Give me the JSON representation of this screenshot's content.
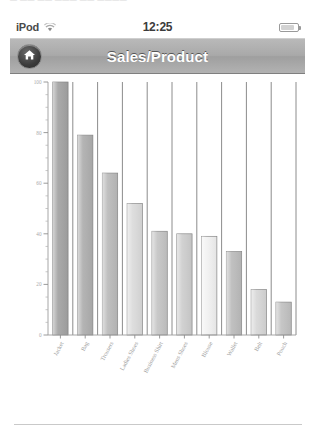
{
  "page": {
    "top_artifact_text": "— —— ——  ——— —— ————",
    "divider": "page-divider"
  },
  "statusbar": {
    "carrier": "iPod",
    "wifi_icon": "wifi-icon",
    "time": "12:25",
    "battery_icon": "battery-icon",
    "battery_level": 72
  },
  "navbar": {
    "home_icon": "home-icon",
    "title": "Sales/Product"
  },
  "chart_data": {
    "type": "bar",
    "title": "Sales/Product",
    "xlabel": "",
    "ylabel": "",
    "ylim": [
      0,
      100
    ],
    "yticks": [
      0,
      20,
      40,
      60,
      80,
      100
    ],
    "ytick_labels": [
      "0",
      "20",
      "40",
      "60",
      "80",
      "100"
    ],
    "minor_tick_step": 5,
    "grid": true,
    "grid_axis": "x",
    "legend": "none",
    "categories": [
      "Jacket",
      "Bag",
      "Trousers",
      "Ladies Shoes",
      "Business Shirt",
      "Mens Shoes",
      "Blouse",
      "Wallet",
      "Belt",
      "Pouch"
    ],
    "values": [
      100,
      79,
      64,
      52,
      41,
      40,
      39,
      33,
      18,
      13
    ],
    "bar_colors": [
      "#a5a5a5",
      "#b0b0b0",
      "#bcbcbc",
      "#dcdcdc",
      "#c6c6c6",
      "#cfcfcf",
      "#f2f2f2",
      "#bdbdbd",
      "#d8d8d8",
      "#c3c3c3"
    ]
  }
}
